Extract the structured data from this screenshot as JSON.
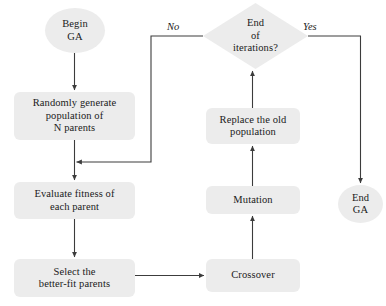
{
  "diagram": {
    "background_color": "#ffffff",
    "node_fill_color": "#ececec",
    "line_color": "#3c3c3c",
    "text_color": "#1a1a1a",
    "nodes": [
      {
        "id": "begin",
        "shape": "ellipse",
        "label": "Begin\nGA",
        "x": 45,
        "y": 8,
        "w": 60,
        "h": 45
      },
      {
        "id": "randomly-generate",
        "shape": "rounded-rect",
        "label": "Randomly generate\npopulation of\nN parents",
        "x": 14,
        "y": 92,
        "w": 121,
        "h": 48
      },
      {
        "id": "evaluate-fitness",
        "shape": "rounded-rect",
        "label": "Evaluate fitness of\neach parent",
        "x": 14,
        "y": 182,
        "w": 121,
        "h": 37
      },
      {
        "id": "select-better-fit",
        "shape": "rounded-rect",
        "label": "Select the\nbetter-fit parents",
        "x": 14,
        "y": 259,
        "w": 121,
        "h": 38
      },
      {
        "id": "crossover",
        "shape": "rounded-rect",
        "label": "Crossover",
        "x": 206,
        "y": 259,
        "w": 94,
        "h": 33
      },
      {
        "id": "mutation",
        "shape": "rounded-rect",
        "label": "Mutation",
        "x": 206,
        "y": 186,
        "w": 94,
        "h": 28
      },
      {
        "id": "replace-population",
        "shape": "rounded-rect",
        "label": "Replace the old\npopulation",
        "x": 206,
        "y": 108,
        "w": 94,
        "h": 36
      },
      {
        "id": "end-of-iterations",
        "shape": "diamond",
        "label": "End\nof\niterations?",
        "x": 203,
        "y": 3,
        "w": 105,
        "h": 66
      },
      {
        "id": "end",
        "shape": "ellipse",
        "label": "End\nGA",
        "x": 338,
        "y": 185,
        "w": 45,
        "h": 38
      }
    ],
    "edge_labels": [
      {
        "id": "no-label",
        "text": "No",
        "x": 167,
        "y": 21
      },
      {
        "id": "yes-label",
        "text": "Yes",
        "x": 303,
        "y": 21
      }
    ],
    "edges": [
      {
        "id": "begin-to-randomly-generate",
        "from": "begin",
        "to": "randomly-generate"
      },
      {
        "id": "randomly-generate-to-evaluate",
        "from": "randomly-generate",
        "to": "evaluate-fitness"
      },
      {
        "id": "evaluate-to-select",
        "from": "evaluate-fitness",
        "to": "select-better-fit"
      },
      {
        "id": "select-to-crossover",
        "from": "select-better-fit",
        "to": "crossover"
      },
      {
        "id": "crossover-to-mutation",
        "from": "crossover",
        "to": "mutation"
      },
      {
        "id": "mutation-to-replace",
        "from": "mutation",
        "to": "replace-population"
      },
      {
        "id": "replace-to-end-of-iterations",
        "from": "replace-population",
        "to": "end-of-iterations"
      },
      {
        "id": "no-branch-to-evaluate",
        "from": "end-of-iterations",
        "to": "evaluate-fitness",
        "label": "No"
      },
      {
        "id": "yes-branch-to-end",
        "from": "end-of-iterations",
        "to": "end",
        "label": "Yes"
      }
    ]
  }
}
